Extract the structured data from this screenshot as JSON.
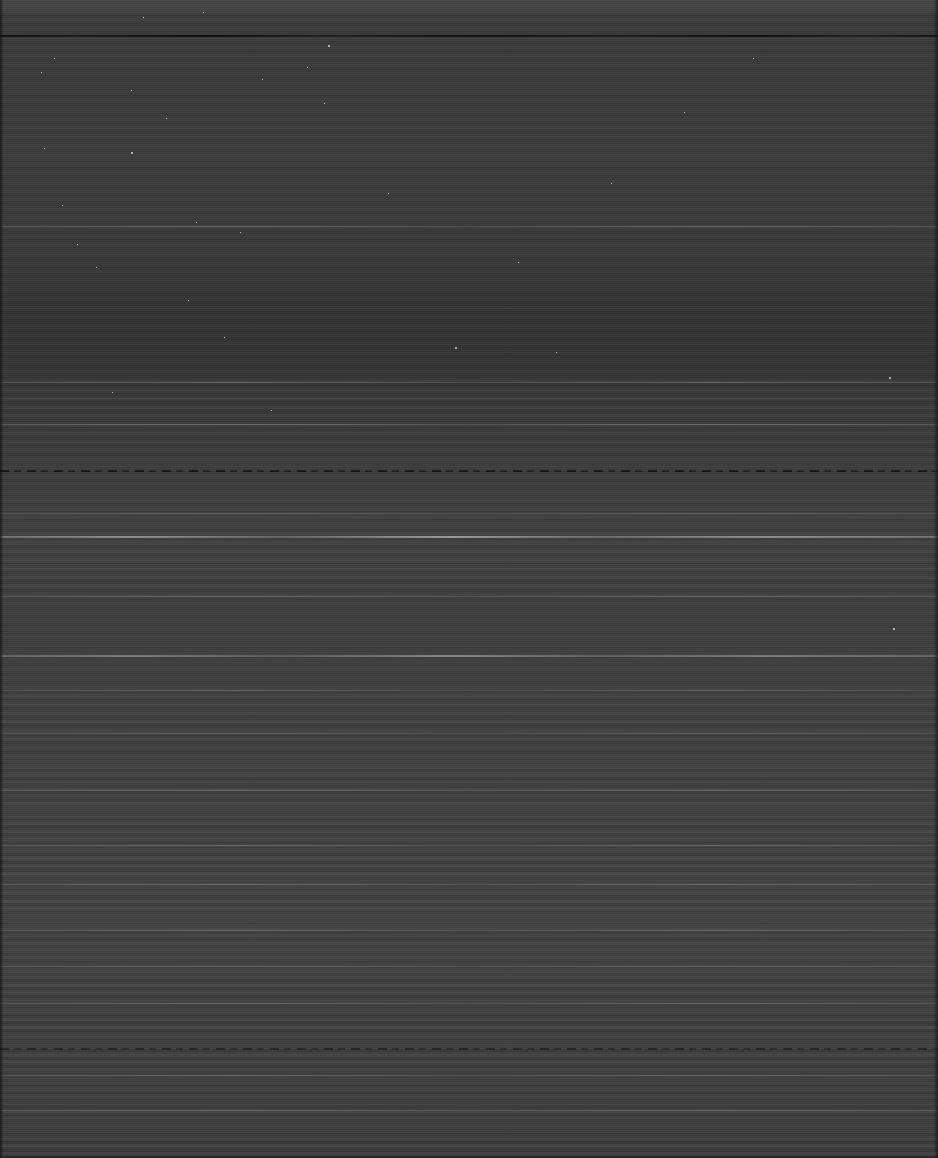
{
  "image": {
    "kind": "degraded-scan",
    "description": "Severely underexposed, near-black scanned page with horizontal scanline banding artifacts. No legible text or UI content is discernible in the pixels.",
    "width": 938,
    "height": 1158,
    "legible_text": "",
    "colors": {
      "background": "#3a3a3a",
      "header_band": "#464646",
      "dark_rule": "#0c0c0c",
      "bright_rule": "#b0b0b0",
      "edge_border": "#0e0e0e",
      "speckle": "#ebebeb"
    }
  },
  "features": {
    "header_band": {
      "label": "header-band",
      "top": 0,
      "height": 14
    },
    "rules": [
      {
        "label": "top-dark-rule",
        "type": "dark",
        "top": 35
      },
      {
        "label": "mid-dashed-rule",
        "type": "dashed",
        "top": 470
      },
      {
        "label": "mid-bright-separator",
        "type": "bright",
        "top": 536
      },
      {
        "label": "lower-bright-separator",
        "type": "bright",
        "top": 655
      },
      {
        "label": "lower-dashed-rule",
        "type": "dashed",
        "top": 1048
      }
    ],
    "soft_lines": [
      226,
      382,
      424,
      513,
      596,
      690,
      733,
      790,
      845,
      884,
      930,
      966,
      1003,
      1075,
      1110
    ],
    "banding_regions": [
      {
        "label": "upper-clean",
        "top": 40,
        "bottom": 380
      },
      {
        "label": "mid-banded",
        "top": 380,
        "bottom": 760
      },
      {
        "label": "lower-dense-banded",
        "top": 760,
        "bottom": 1158
      }
    ],
    "edges": {
      "left_border_width": 3,
      "right_border_width": 4,
      "bottom_border_height": 3
    }
  },
  "speckles": [
    {
      "x": 54,
      "y": 58,
      "big": false
    },
    {
      "x": 41,
      "y": 72,
      "big": false
    },
    {
      "x": 143,
      "y": 17,
      "big": false
    },
    {
      "x": 203,
      "y": 12,
      "big": false
    },
    {
      "x": 328,
      "y": 45,
      "big": true
    },
    {
      "x": 44,
      "y": 148,
      "big": false
    },
    {
      "x": 131,
      "y": 152,
      "big": true
    },
    {
      "x": 62,
      "y": 205,
      "big": false
    },
    {
      "x": 196,
      "y": 222,
      "big": false
    },
    {
      "x": 131,
      "y": 90,
      "big": false
    },
    {
      "x": 240,
      "y": 232,
      "big": false
    },
    {
      "x": 324,
      "y": 103,
      "big": false
    },
    {
      "x": 262,
      "y": 79,
      "big": false
    },
    {
      "x": 96,
      "y": 267,
      "big": false
    },
    {
      "x": 188,
      "y": 300,
      "big": false
    },
    {
      "x": 224,
      "y": 337,
      "big": false
    },
    {
      "x": 455,
      "y": 347,
      "big": true
    },
    {
      "x": 556,
      "y": 352,
      "big": false
    },
    {
      "x": 611,
      "y": 183,
      "big": false
    },
    {
      "x": 889,
      "y": 377,
      "big": true
    },
    {
      "x": 893,
      "y": 628,
      "big": true
    },
    {
      "x": 307,
      "y": 67,
      "big": false
    },
    {
      "x": 112,
      "y": 392,
      "big": false
    },
    {
      "x": 77,
      "y": 244,
      "big": false
    },
    {
      "x": 166,
      "y": 118,
      "big": false
    },
    {
      "x": 388,
      "y": 193,
      "big": false
    },
    {
      "x": 271,
      "y": 410,
      "big": false
    },
    {
      "x": 518,
      "y": 262,
      "big": false
    },
    {
      "x": 684,
      "y": 112,
      "big": false
    },
    {
      "x": 753,
      "y": 58,
      "big": false
    }
  ]
}
